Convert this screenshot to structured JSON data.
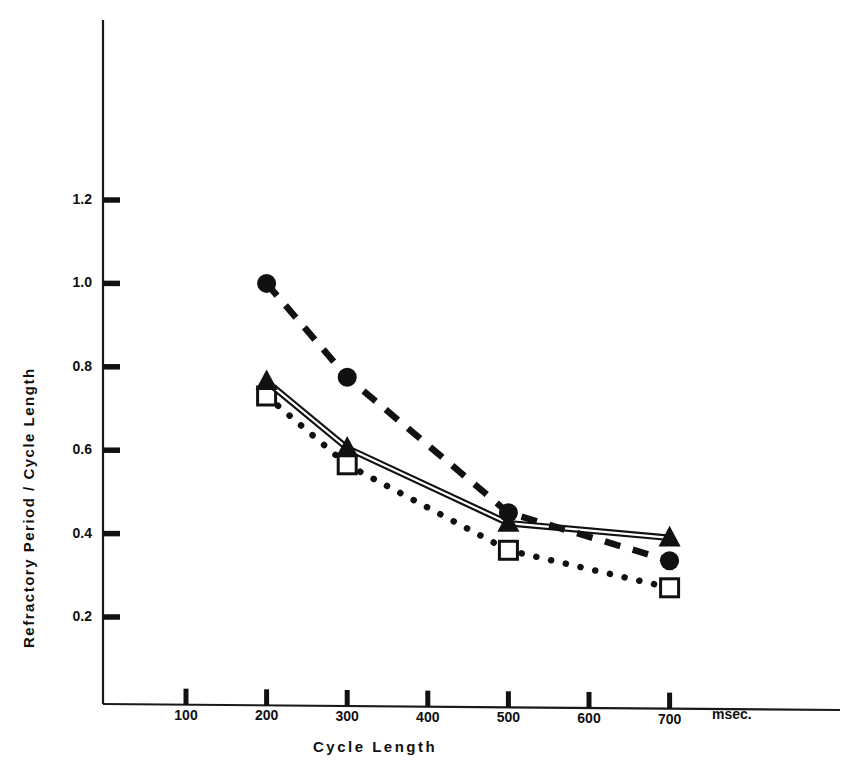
{
  "chart_data": {
    "type": "line",
    "title": "",
    "xlabel": "Cycle    Length",
    "ylabel": "Refractory Period / Cycle Length",
    "x_unit": "msec.",
    "xlim": [
      0,
      780
    ],
    "ylim": [
      0,
      1.32
    ],
    "grid": false,
    "legend_position": "none",
    "xticks": [
      100,
      200,
      300,
      400,
      500,
      600,
      700
    ],
    "xtick_labels": [
      "100",
      "200",
      "300",
      "400",
      "500",
      "600",
      "700"
    ],
    "yticks": [
      0.2,
      0.4,
      0.6,
      0.8,
      1.0,
      1.2
    ],
    "ytick_labels": [
      "0.2",
      "0.4",
      "0.6",
      "0.8",
      "1.0",
      "1.2"
    ],
    "series": [
      {
        "name": "filled-circle-series",
        "marker": "filled-circle",
        "line_style": "dashed",
        "color": "#111111",
        "x": [
          200,
          300,
          500,
          700
        ],
        "values": [
          1.0,
          0.775,
          0.45,
          0.335
        ]
      },
      {
        "name": "filled-triangle-series",
        "marker": "filled-triangle",
        "line_style": "double-solid",
        "color": "#111111",
        "x": [
          200,
          300,
          500,
          700
        ],
        "values": [
          0.765,
          0.605,
          0.425,
          0.39
        ]
      },
      {
        "name": "open-square-series",
        "marker": "open-square",
        "line_style": "dotted",
        "color": "#111111",
        "x": [
          200,
          300,
          500,
          700
        ],
        "values": [
          0.73,
          0.565,
          0.36,
          0.27
        ]
      }
    ]
  },
  "axes": {
    "ylabel": "Refractory Period / Cycle Length",
    "xlabel": "Cycle    Length",
    "unit": "msec."
  },
  "ticks": {
    "y": [
      "1.2",
      "1.0",
      "0.8",
      "0.6",
      "0.4",
      "0.2"
    ],
    "x": [
      "100",
      "200",
      "300",
      "400",
      "500",
      "600",
      "700"
    ]
  }
}
